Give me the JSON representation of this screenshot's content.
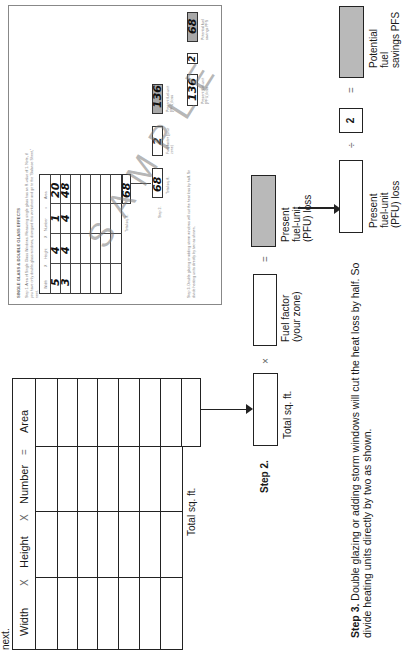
{
  "top_text": "next.",
  "table": {
    "headers": [
      "Width",
      "X",
      "Height",
      "X",
      "Number",
      "=",
      "Area"
    ],
    "row_count": 7,
    "total_label": "Total sq. ft."
  },
  "step2": {
    "label": "Step 2.",
    "boxes": [
      {
        "caption": "Total sq. ft.",
        "value": ""
      },
      {
        "caption_line1": "Fuel factor",
        "caption_line2": "(your zone)",
        "value": ""
      },
      {
        "caption_line1": "Present",
        "caption_line2": "fuel-unit",
        "caption_line3": "(PFU) loss",
        "value": ""
      }
    ],
    "operators": [
      "×",
      "="
    ]
  },
  "step3": {
    "label": "Step 3.",
    "text_line1": "Double glazing or adding storm windows will cut the heat loss by half.  So",
    "text_line2": "divide heating units directly by two as shown.",
    "boxes": [
      {
        "caption_line1": "Present",
        "caption_line2": "fuel-unit",
        "caption_line3": "(PFU) loss",
        "value": ""
      },
      {
        "value": "2"
      },
      {
        "caption_line1": "Potential",
        "caption_line2": "fuel",
        "caption_line3": "savings PFS",
        "value": ""
      }
    ],
    "operators": [
      "÷",
      "="
    ]
  },
  "sample": {
    "title": "SINGLE GLASS & DOUBLE GLASS EFFECTS",
    "step1_line1": "Step 1. Area of Single Glass Windows. Measuring single glass has an R-value of 1. Note, if",
    "step1_line2": "you have only double-glass windows, disregard this worksheet and go to the \"Balance Sheet,\"",
    "step1_line3": "next.",
    "headers": [
      "Width",
      "X",
      "Height",
      "X",
      "Number",
      "=",
      "Area"
    ],
    "rows": [
      {
        "width": "5",
        "height": "4",
        "number": "1",
        "area": "20"
      },
      {
        "width": "3",
        "height": "4",
        "number": "4",
        "area": "48"
      }
    ],
    "total": "68",
    "total_label": "Total sq. ft.",
    "step2_label": "Step 2.",
    "step2_values": [
      "68",
      "2",
      "136"
    ],
    "step2_captions": [
      "Total sq. ft.",
      "Fuel factor (your zone)",
      "Present fuel-unit (PFU) loss"
    ],
    "step3_line1": "Step 3. Double glazing or adding storm windows will cut the heat loss by half. So",
    "step3_line2": "divide heating units directly by two as shown.",
    "step3_values": [
      "136",
      "2",
      "68"
    ],
    "step3_captions": [
      "Present fuel-unit (PFU) loss",
      "Potential fuel savings PFS"
    ],
    "watermark": "SAMPLE"
  }
}
